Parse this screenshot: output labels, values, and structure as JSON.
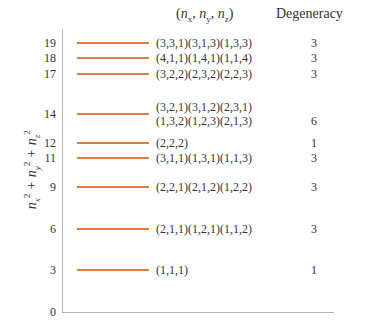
{
  "header": {
    "config_label": "(n_x, n_y, n_z)",
    "degeneracy_label": "Degeneracy"
  },
  "y_axis_label": "n_x^2 + n_y^2 + n_z^2",
  "levels": [
    {
      "energy": "19",
      "configs": [
        "(3,3,1)(3,1,3)(1,3,3)"
      ],
      "degeneracy": "3",
      "y": 43
    },
    {
      "energy": "18",
      "configs": [
        "(4,1,1)(1,4,1)(1,1,4)"
      ],
      "degeneracy": "3",
      "y": 58
    },
    {
      "energy": "17",
      "configs": [
        "(3,2,2)(2,3,2)(2,2,3)"
      ],
      "degeneracy": "3",
      "y": 74
    },
    {
      "energy": "14",
      "configs": [
        "(3,2,1)(3,1,2)(2,3,1)",
        "(1,3,2)(1,2,3)(2,1,3)"
      ],
      "degeneracy": "6",
      "y": 114
    },
    {
      "energy": "12",
      "configs": [
        "(2,2,2)"
      ],
      "degeneracy": "1",
      "y": 143
    },
    {
      "energy": "11",
      "configs": [
        "(3,1,1)(1,3,1)(1,1,3)"
      ],
      "degeneracy": "3",
      "y": 158
    },
    {
      "energy": "9",
      "configs": [
        "(2,2,1)(2,1,2)(1,2,2)"
      ],
      "degeneracy": "3",
      "y": 187
    },
    {
      "energy": "6",
      "configs": [
        "(2,1,1)(1,2,1)(1,1,2)"
      ],
      "degeneracy": "3",
      "y": 229
    },
    {
      "energy": "3",
      "configs": [
        "(1,1,1)"
      ],
      "degeneracy": "1",
      "y": 270
    }
  ],
  "zero_tick": "0",
  "colors": {
    "level_line": "#e07b39",
    "axis": "#b0b0b0",
    "text": "#333333"
  }
}
